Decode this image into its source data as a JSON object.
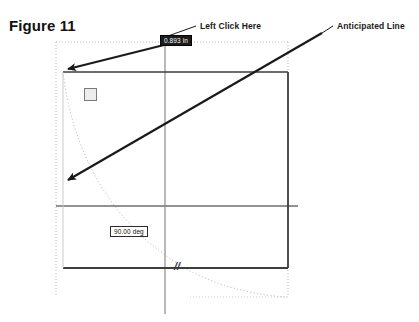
{
  "figure": {
    "title": "Figure 11",
    "domain_note": "CAD sketch tutorial figure"
  },
  "callouts": [
    {
      "id": "left-click-here",
      "label": "Left Click Here"
    },
    {
      "id": "anticipated-line",
      "label": "Anticipated Line"
    }
  ],
  "dimensions": {
    "selected_length": "0.893 in",
    "angle": "90.00 deg"
  },
  "constraints": [
    {
      "id": "parallel-icon",
      "glyph": "//",
      "name": "parallel-constraint-icon"
    },
    {
      "id": "parallel-marker",
      "glyph": "//",
      "name": "parallel-marker-glyph"
    }
  ],
  "colors": {
    "sketch_line": "#3d3d3d",
    "axis_line": "#6b6b6b",
    "construction_dotted": "#b9b9b9",
    "arrow": "#1a1a1a",
    "selected_fill": "#1c1c1c",
    "background": "#ffffff"
  },
  "geometry": {
    "rectangle": {
      "x": 63,
      "y": 72,
      "width": 225,
      "height": 196
    },
    "construction_box": {
      "x": 56,
      "y": 42,
      "width": 232,
      "height": 255
    },
    "horizontal_axis_y": 206,
    "vertical_axis_x": 165,
    "arc_note": "dotted arc sweeping from rectangle top-left corner toward lower right"
  }
}
